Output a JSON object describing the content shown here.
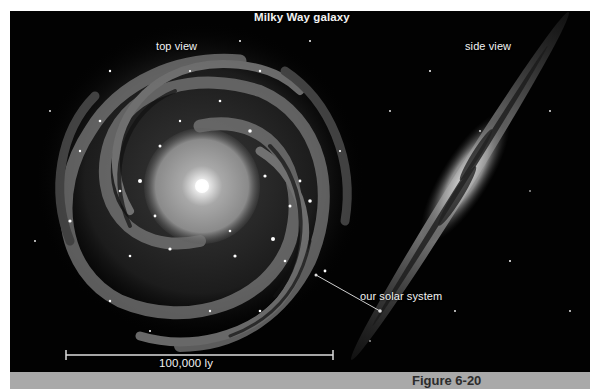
{
  "figure": {
    "title": "Milky Way galaxy",
    "labels": {
      "top_view": "top view",
      "side_view": "side view",
      "solar_system": "our solar system"
    },
    "scale_bar": {
      "label": "100,000 ly"
    },
    "caption": "Figure 6-20"
  },
  "colors": {
    "background": "#020202",
    "caption_bar": "#a9a9a9",
    "caption_text": "#2c2c2c",
    "label_text": "#f2f2f2"
  }
}
